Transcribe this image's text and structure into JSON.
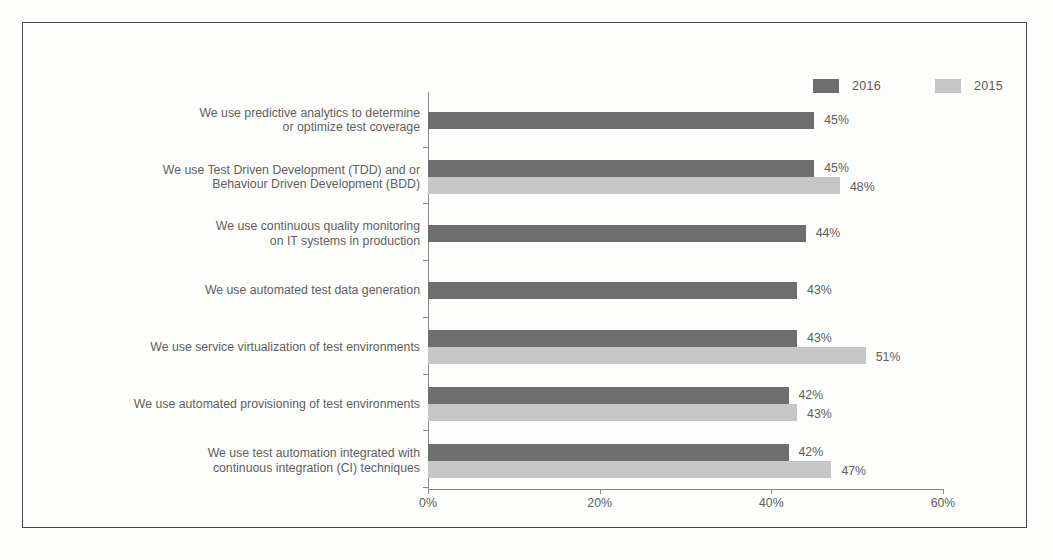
{
  "chart_data": {
    "type": "bar",
    "orientation": "horizontal",
    "title": "",
    "xlabel": "",
    "ylabel": "",
    "xlim": [
      0,
      60
    ],
    "xticks": [
      "0%",
      "20%",
      "40%",
      "60%"
    ],
    "xtick_values": [
      0,
      20,
      40,
      60
    ],
    "grid": false,
    "legend_position": "top-right",
    "categories": [
      "We use predictive analytics to determine\nor optimize test coverage",
      "We use Test Driven Development (TDD) and  or\nBehaviour Driven Development (BDD)",
      "We use continuous quality monitoring\non IT systems in production",
      "We use automated  test data generation",
      "We use service virtualization of test environments",
      "We use automated provisioning of test environments",
      "We use test automation integrated with\ncontinuous integration (CI) techniques"
    ],
    "series": [
      {
        "name": "2016",
        "color": "#6e6e6e",
        "values": [
          45,
          45,
          44,
          43,
          43,
          42,
          42
        ],
        "labels": [
          "45%",
          "45%",
          "44%",
          "43%",
          "43%",
          "42%",
          "42%"
        ]
      },
      {
        "name": "2015",
        "color": "#c6c6c6",
        "values": [
          null,
          48,
          null,
          null,
          51,
          43,
          47
        ],
        "labels": [
          "",
          "48%",
          "",
          "",
          "51%",
          "43%",
          "47%"
        ]
      }
    ]
  },
  "legend": {
    "items": [
      {
        "label": "2016",
        "color": "#6e6e6e"
      },
      {
        "label": "2015",
        "color": "#c6c6c6"
      }
    ]
  }
}
